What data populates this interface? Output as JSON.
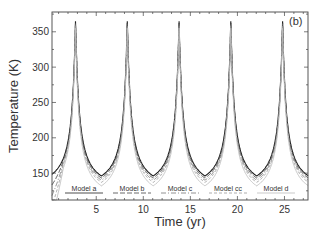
{
  "chart_data": {
    "type": "line",
    "title": "",
    "panel_label": "(b)",
    "xlabel": "Time (yr)",
    "ylabel": "Temperature (K)",
    "xlim": [
      0.3,
      27.5
    ],
    "ylim": [
      112,
      378
    ],
    "xticks": [
      5,
      10,
      15,
      20,
      25
    ],
    "yticks": [
      150,
      200,
      250,
      300,
      350
    ],
    "grid": false,
    "legend_position": "bottom-inside",
    "period_yr": 5.5,
    "peak_times": [
      2.8,
      8.3,
      13.8,
      19.3,
      24.8
    ],
    "series": [
      {
        "name": "Model a",
        "color": "#222222",
        "dash": "",
        "peak": 365,
        "min": 146,
        "width": 1.1
      },
      {
        "name": "Model b",
        "color": "#444444",
        "dash": "5,2",
        "peak": 362,
        "min": 143,
        "width": 1.0
      },
      {
        "name": "Model c",
        "color": "#777777",
        "dash": "5,2,1,2",
        "peak": 360,
        "min": 140,
        "width": 0.9
      },
      {
        "name": "Model cc",
        "color": "#999999",
        "dash": "3,2",
        "peak": 358,
        "min": 137,
        "width": 0.9
      },
      {
        "name": "Model d",
        "color": "#bbbbbb",
        "dash": "",
        "peak": 355,
        "min": 132,
        "width": 0.9
      }
    ]
  }
}
